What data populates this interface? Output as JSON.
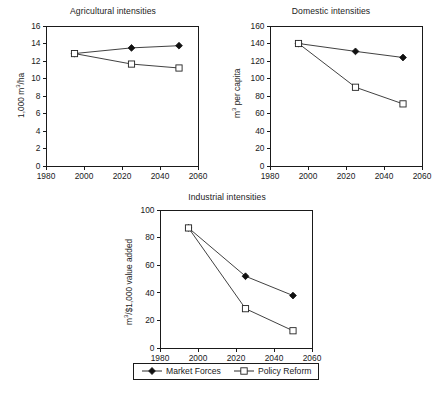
{
  "figure": {
    "background": "#ffffff",
    "line_color": "#2b2b2b",
    "axis_color": "#1a1a1a"
  },
  "legend": {
    "position": "bottom-center",
    "items": [
      {
        "label": "Market Forces",
        "marker": "filled-diamond-icon"
      },
      {
        "label": "Policy Reform",
        "marker": "open-square-icon"
      }
    ]
  },
  "chart_data": [
    {
      "type": "line",
      "title": "Agricultural intensities",
      "xlabel": "",
      "ylabel": "1,000 m³/ha",
      "ylabel_parts": {
        "pre": "1,000 m",
        "sup": "3",
        "post": "/ha"
      },
      "x": [
        1995,
        2025,
        2050
      ],
      "xlim": [
        1980,
        2060
      ],
      "ylim": [
        0,
        16
      ],
      "xticks": [
        1980,
        2000,
        2020,
        2040,
        2060
      ],
      "yticks": [
        0,
        2,
        4,
        6,
        8,
        10,
        12,
        14,
        16
      ],
      "grid": false,
      "series": [
        {
          "name": "Market Forces",
          "marker": "filled-diamond",
          "values": [
            12.85,
            13.5,
            13.75
          ]
        },
        {
          "name": "Policy Reform",
          "marker": "open-square",
          "values": [
            12.85,
            11.65,
            11.2
          ]
        }
      ]
    },
    {
      "type": "line",
      "title": "Domestic intensities",
      "xlabel": "",
      "ylabel": "m³ per capita",
      "ylabel_parts": {
        "pre": "m",
        "sup": "3",
        "post": " per capita"
      },
      "x": [
        1995,
        2025,
        2050
      ],
      "xlim": [
        1980,
        2060
      ],
      "ylim": [
        0,
        160
      ],
      "xticks": [
        1980,
        2000,
        2020,
        2040,
        2060
      ],
      "yticks": [
        0,
        20,
        40,
        60,
        80,
        100,
        120,
        140,
        160
      ],
      "grid": false,
      "series": [
        {
          "name": "Market Forces",
          "marker": "filled-diamond",
          "values": [
            140,
            131,
            124
          ]
        },
        {
          "name": "Policy Reform",
          "marker": "open-square",
          "values": [
            140,
            90,
            71
          ]
        }
      ]
    },
    {
      "type": "line",
      "title": "Industrial intensities",
      "xlabel": "",
      "ylabel": "m³/$1,000 value added",
      "ylabel_parts": {
        "pre": "m",
        "sup": "3",
        "post": "/$1,000 value added"
      },
      "x": [
        1995,
        2025,
        2050
      ],
      "xlim": [
        1980,
        2060
      ],
      "ylim": [
        0,
        100
      ],
      "xticks": [
        1980,
        2000,
        2020,
        2040,
        2060
      ],
      "yticks": [
        0,
        20,
        40,
        60,
        80,
        100
      ],
      "grid": false,
      "series": [
        {
          "name": "Market Forces",
          "marker": "filled-diamond",
          "values": [
            87,
            52,
            38
          ]
        },
        {
          "name": "Policy Reform",
          "marker": "open-square",
          "values": [
            87,
            28.5,
            12.5
          ]
        }
      ]
    }
  ]
}
